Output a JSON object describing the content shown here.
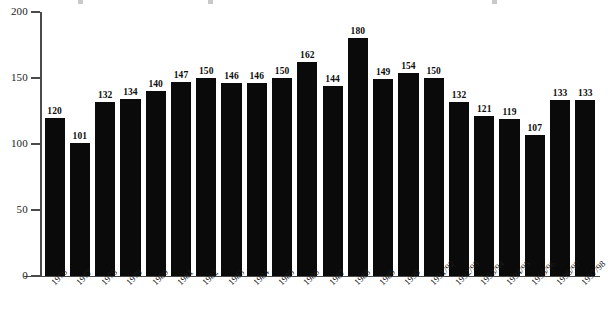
{
  "chart_data": {
    "type": "bar",
    "title": "",
    "subtitle": "",
    "xlabel": "",
    "ylabel": "",
    "ylim": [
      0,
      200
    ],
    "yticks": [
      0,
      50,
      100,
      150,
      200
    ],
    "grid": false,
    "legend": false,
    "bar_color": "#0a0a0a",
    "axis_color": "#4a4a4a",
    "categories": [
      "1976",
      "1977",
      "1978",
      "1979",
      "1980",
      "1981",
      "1982",
      "1983",
      "1984",
      "1985",
      "1986",
      "1987",
      "1988",
      "1989",
      "1990",
      "1991/92",
      "1992/93",
      "1993/94",
      "1994/95",
      "1995/96",
      "1996/97",
      "1997/98"
    ],
    "values": [
      120,
      101,
      132,
      134,
      140,
      147,
      150,
      146,
      146,
      150,
      162,
      144,
      180,
      149,
      154,
      150,
      132,
      121,
      119,
      107,
      133,
      133
    ],
    "value_labels": [
      "120",
      "101",
      "132",
      "134",
      "140",
      "147",
      "150",
      "146",
      "146",
      "150",
      "162",
      "144",
      "180",
      "149",
      "154",
      "150",
      "132",
      "121",
      "119",
      "107",
      "133",
      "133"
    ],
    "ytick_labels": [
      "0",
      "50",
      "100",
      "150",
      "200"
    ]
  }
}
